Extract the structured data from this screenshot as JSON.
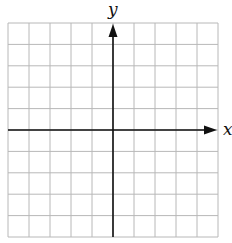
{
  "chart_data": {
    "type": "grid",
    "title": "",
    "xlabel": "x",
    "ylabel": "y",
    "grid": true,
    "grid_columns": 10,
    "grid_rows": 10,
    "xlim": [
      -5,
      5
    ],
    "ylim": [
      -5,
      5
    ],
    "x_tick_labels": [],
    "y_tick_labels": [],
    "series": [],
    "axes": {
      "x_axis_arrow": "right",
      "y_axis_arrow": "up",
      "origin_col": 5,
      "origin_row": 5
    }
  },
  "labels": {
    "x_axis": "x",
    "y_axis": "y"
  },
  "colors": {
    "grid_line": "#b8b8b8",
    "axis": "#111111",
    "background": "#ffffff"
  },
  "layout": {
    "grid_left": 8,
    "grid_top": 23,
    "grid_right": 218,
    "grid_bottom": 237
  }
}
